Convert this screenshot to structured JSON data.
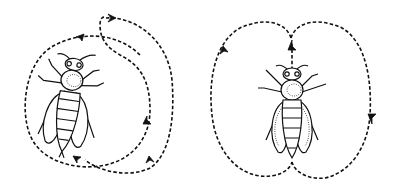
{
  "diagram": {
    "background": "#ffffff",
    "ink": "#111111",
    "panels": [
      {
        "name": "round-dance",
        "description": "Bee with circular dashed path looping around it, arrows showing alternating direction",
        "bee": {
          "cx": 68,
          "cy": 110,
          "orientation": "slightly tilted"
        },
        "path_arrows": 5
      },
      {
        "name": "waggle-dance",
        "description": "Bee centered with figure-eight (two lobes) dashed path; straight run through the bee's axis",
        "bee": {
          "cx": 292,
          "cy": 110,
          "orientation": "upright"
        },
        "path_arrows": 3
      }
    ]
  }
}
